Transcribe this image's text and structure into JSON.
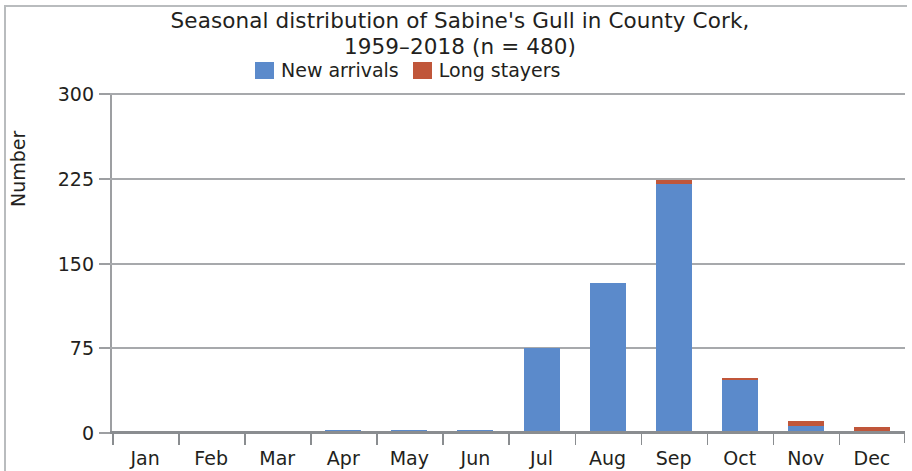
{
  "chart_data": {
    "type": "bar",
    "subtype": "stacked-bar",
    "title": "Seasonal distribution of Sabine's Gull in County Cork,\n1959–2018 (n = 480)",
    "title_line1": "Seasonal distribution of Sabine's Gull in County Cork,",
    "title_line2": "1959–2018 (n = 480)",
    "xlabel": "",
    "ylabel": "Number",
    "ylim": [
      0,
      300
    ],
    "yticks": [
      0,
      75,
      150,
      225,
      300
    ],
    "ytick_labels": [
      "0",
      "75",
      "150",
      "225",
      "300"
    ],
    "grid": "horizontal",
    "legend_position": "top-center",
    "categories": [
      "Jan",
      "Feb",
      "Mar",
      "Apr",
      "May",
      "Jun",
      "Jul",
      "Aug",
      "Sep",
      "Oct",
      "Nov",
      "Dec"
    ],
    "series": [
      {
        "name": "New arrivals",
        "color": "#5b8acb",
        "values": [
          0,
          0,
          0,
          3,
          3,
          3,
          75,
          133,
          220,
          47,
          6,
          0
        ]
      },
      {
        "name": "Long stayers",
        "color": "#c0563a",
        "values": [
          0,
          0,
          0,
          0,
          0,
          0,
          0,
          0,
          4,
          2,
          5,
          5
        ]
      }
    ],
    "totals": [
      0,
      0,
      0,
      3,
      3,
      3,
      75,
      133,
      224,
      49,
      11,
      5
    ],
    "n_total": 480
  },
  "legend": {
    "items": [
      {
        "label": "New arrivals",
        "color": "#5b8acb"
      },
      {
        "label": "Long stayers",
        "color": "#c0563a"
      }
    ]
  },
  "axis": {
    "y_title": "Number"
  }
}
